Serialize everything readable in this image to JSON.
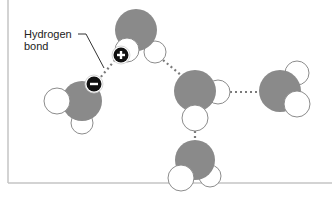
{
  "diagram": {
    "label": {
      "line1": "Hydrogen",
      "line2": "bond"
    },
    "colors": {
      "oxygen": "#8a8a8a",
      "hydrogen": "#ffffff",
      "outline": "#8c8c8c",
      "bond": "#7a7a7a",
      "badge": "#111111",
      "badge_ring": "#ffffff",
      "frame": "#c4c4c4",
      "text": "#222222"
    },
    "frame": {
      "left_x": 8,
      "bottom_y": 183
    },
    "charges": [
      {
        "name": "positive-charge",
        "symbol": "+",
        "x": 121,
        "y": 55
      },
      {
        "name": "negative-charge",
        "symbol": "−",
        "x": 94,
        "y": 84
      }
    ],
    "molecules": [
      {
        "name": "water-molecule-top",
        "o": [
          136,
          30,
          21
        ],
        "h_back": [
          [
            155,
            52,
            11
          ]
        ],
        "h_front": [
          [
            127,
            50,
            12
          ]
        ]
      },
      {
        "name": "water-molecule-left",
        "o": [
          82,
          101,
          20
        ],
        "h_back": [
          [
            82,
            123,
            11
          ]
        ],
        "h_front": [
          [
            57,
            101,
            13
          ]
        ]
      },
      {
        "name": "water-molecule-center",
        "o": [
          195,
          91,
          21
        ],
        "h_back": [
          [
            218,
            92,
            12
          ]
        ],
        "h_front": [
          [
            195,
            118,
            13
          ]
        ]
      },
      {
        "name": "water-molecule-right",
        "o": [
          280,
          91,
          21
        ],
        "h_back": [
          [
            297,
            73,
            12
          ]
        ],
        "h_front": [
          [
            297,
            104,
            13
          ]
        ]
      },
      {
        "name": "water-molecule-bottom",
        "o": [
          195,
          160,
          20
        ],
        "h_back": [
          [
            210,
            176,
            11
          ]
        ],
        "h_front": [
          [
            181,
            178,
            13
          ]
        ]
      }
    ],
    "bonds": [
      {
        "name": "hydrogen-bond-top-left",
        "from": [
          115,
          60
        ],
        "to": [
          100,
          78
        ]
      },
      {
        "name": "hydrogen-bond-top-center",
        "from": [
          163,
          60
        ],
        "to": [
          182,
          76
        ]
      },
      {
        "name": "hydrogen-bond-center-right",
        "from": [
          230,
          92
        ],
        "to": [
          259,
          92
        ]
      },
      {
        "name": "hydrogen-bond-center-bottom",
        "from": [
          195,
          131
        ],
        "to": [
          195,
          140
        ]
      }
    ],
    "leader": {
      "points": [
        [
          78,
          34
        ],
        [
          86,
          34
        ],
        [
          104,
          68
        ]
      ]
    }
  }
}
